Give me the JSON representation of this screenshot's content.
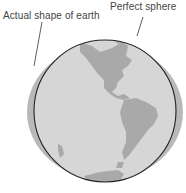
{
  "diagram": {
    "labels": {
      "actual_shape": "Actual shape of earth",
      "perfect_sphere": "Perfect sphere"
    },
    "colors": {
      "actual_shape_fill": "#b9b9b9",
      "sphere_fill": "#d6d6d6",
      "land": "#a9a9a9",
      "outline": "#222222",
      "leader_line": "#333333"
    },
    "depicts": [
      "North America",
      "Central America",
      "South America",
      "Antarctica edge"
    ]
  }
}
